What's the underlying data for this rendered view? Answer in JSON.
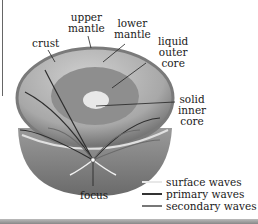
{
  "diagram": {
    "type": "earth-interior-cross-section",
    "top_cut_text": "...",
    "layers": [
      {
        "id": "crust",
        "label": "crust"
      },
      {
        "id": "upper_mantle",
        "label": "upper\nmantle"
      },
      {
        "id": "lower_mantle",
        "label": "lower\nmantle"
      },
      {
        "id": "liquid_outer_core",
        "label": "liquid\nouter\ncore"
      },
      {
        "id": "solid_inner_core",
        "label": "solid\ninner\ncore"
      }
    ],
    "focus_label": "focus",
    "legend": [
      {
        "label": "surface waves",
        "color": "#e8e8e8"
      },
      {
        "label": "primary waves",
        "color": "#333333"
      },
      {
        "label": "secondary waves",
        "color": "#777777"
      }
    ],
    "colors": {
      "crust_edge": "#8a8a8a",
      "mantle": "#b4b4b4",
      "outer_core": "#8c8c8c",
      "inner_core": "#e6e6e6",
      "cut_face": "#7a7a7a"
    }
  }
}
